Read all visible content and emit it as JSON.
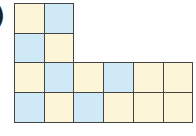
{
  "label": {
    "text": ")"
  },
  "grid": {
    "origin": [
      14,
      3
    ],
    "cell_size": 29.7,
    "colors": {
      "Y": "#fdf5d8",
      "B": "#cfeaf6"
    },
    "rows": [
      [
        "Y",
        "B",
        null,
        null,
        null,
        null
      ],
      [
        "B",
        "Y",
        null,
        null,
        null,
        null
      ],
      [
        "Y",
        "B",
        "Y",
        "B",
        "Y",
        "Y"
      ],
      [
        "B",
        "Y",
        "B",
        "Y",
        "Y",
        "Y"
      ]
    ]
  }
}
